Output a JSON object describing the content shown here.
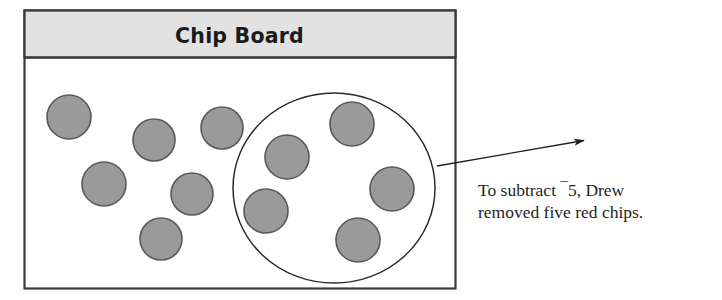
{
  "figure": {
    "board": {
      "title": "Chip Board",
      "title_band_color": "#e2e2e2",
      "border_color": "#3a3a3a",
      "fill_color": "#ffffff",
      "x": 24,
      "y": 10,
      "width": 431,
      "height": 278,
      "band_height": 47
    },
    "chip": {
      "fill_color": "#9a9a9a",
      "stroke_color": "#59595b",
      "radius": 22,
      "count_total": 11,
      "count_circled": 5,
      "count_outside": 6
    },
    "chips": [
      {
        "id": "chip-1",
        "cx": 69,
        "cy": 117,
        "r": 22,
        "circled": false
      },
      {
        "id": "chip-2",
        "cx": 154,
        "cy": 140,
        "r": 21,
        "circled": false
      },
      {
        "id": "chip-3",
        "cx": 222,
        "cy": 128,
        "r": 21,
        "circled": false
      },
      {
        "id": "chip-4",
        "cx": 104,
        "cy": 184,
        "r": 22,
        "circled": false
      },
      {
        "id": "chip-5",
        "cx": 192,
        "cy": 194,
        "r": 21,
        "circled": false
      },
      {
        "id": "chip-6",
        "cx": 161,
        "cy": 239,
        "r": 21,
        "circled": false
      },
      {
        "id": "chip-7",
        "cx": 287,
        "cy": 157,
        "r": 22,
        "circled": true
      },
      {
        "id": "chip-8",
        "cx": 352,
        "cy": 124,
        "r": 22,
        "circled": true
      },
      {
        "id": "chip-9",
        "cx": 266,
        "cy": 211,
        "r": 22,
        "circled": true
      },
      {
        "id": "chip-10",
        "cx": 392,
        "cy": 189,
        "r": 22,
        "circled": true
      },
      {
        "id": "chip-11",
        "cx": 358,
        "cy": 240,
        "r": 22,
        "circled": true
      }
    ],
    "selection_oval": {
      "cx": 334,
      "cy": 188,
      "rx": 101,
      "ry": 95,
      "stroke_color": "#2b2b2b"
    },
    "leader_arrow": {
      "x1": 437,
      "y1": 166,
      "x2": 587,
      "y2": 140,
      "stroke_color": "#1f1f1f"
    },
    "caption": {
      "line1_prefix": "To subtract ",
      "line1_negative_sign": "¯",
      "line1_value": "5",
      "line1_suffix": ", Drew",
      "line2": "removed five red chips.",
      "full_text": "To subtract ¯5, Drew removed five red chips.",
      "x": 478,
      "line1_y": 196,
      "line2_y": 218
    }
  }
}
